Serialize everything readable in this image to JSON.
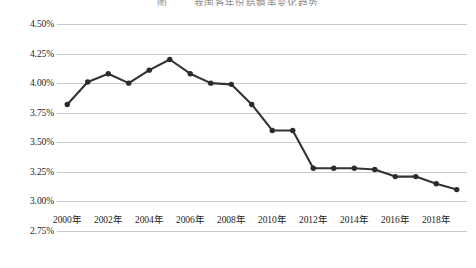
{
  "title": {
    "number": "图",
    "text": "我国各年份结婚率变化趋势"
  },
  "chart_data": {
    "type": "line",
    "title": "我国各年份结婚率变化趋势",
    "xlabel": "",
    "ylabel": "",
    "grid": true,
    "legend": "none",
    "line_color": "#333333",
    "marker_color": "#2b2b2b",
    "gridline_color": "#c9c9c9",
    "ylim": [
      2.75,
      4.5
    ],
    "ytick_values": [
      4.5,
      4.25,
      4.0,
      3.75,
      3.5,
      3.25,
      3.0,
      2.75
    ],
    "ytick_labels": [
      "4.50%",
      "4.25%",
      "4.00%",
      "3.75%",
      "3.50%",
      "3.25%",
      "3.00%",
      "2.75%"
    ],
    "xtick_labels": [
      "2000年",
      "2002年",
      "2004年",
      "2006年",
      "2008年",
      "2010年",
      "2012年",
      "2014年",
      "2016年",
      "2018年"
    ],
    "xtick_values": [
      2000,
      2002,
      2004,
      2006,
      2008,
      2010,
      2012,
      2014,
      2016,
      2018
    ],
    "xlim": [
      1999.5,
      2019.5
    ],
    "x": [
      2000,
      2001,
      2002,
      2003,
      2004,
      2005,
      2006,
      2007,
      2008,
      2009,
      2010,
      2011,
      2012,
      2013,
      2014,
      2015,
      2016,
      2017,
      2018,
      2019
    ],
    "values": [
      3.82,
      4.01,
      4.08,
      4.0,
      4.11,
      4.2,
      4.08,
      4.0,
      3.99,
      3.82,
      3.6,
      3.6,
      3.28,
      3.28,
      3.28,
      3.27,
      3.21,
      3.21,
      3.15,
      3.1
    ],
    "series": [
      {
        "name": "结婚率",
        "values": [
          3.82,
          4.01,
          4.08,
          4.0,
          4.11,
          4.2,
          4.08,
          4.0,
          3.99,
          3.82,
          3.6,
          3.6,
          3.28,
          3.28,
          3.28,
          3.27,
          3.21,
          3.21,
          3.15,
          3.1
        ]
      }
    ]
  }
}
